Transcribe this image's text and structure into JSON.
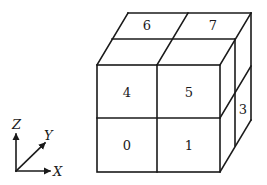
{
  "diagram": {
    "type": "cube-octant-numbering",
    "colors": {
      "stroke": "#1a1a1a",
      "background": "#ffffff"
    },
    "cells": [
      {
        "id": "0",
        "label": "0",
        "face": "front",
        "x": 127,
        "y": 145
      },
      {
        "id": "1",
        "label": "1",
        "face": "front",
        "x": 189,
        "y": 145
      },
      {
        "id": "4",
        "label": "4",
        "face": "front",
        "x": 127,
        "y": 92
      },
      {
        "id": "5",
        "label": "5",
        "face": "front",
        "x": 189,
        "y": 92
      },
      {
        "id": "6",
        "label": "6",
        "face": "top",
        "x": 147,
        "y": 25
      },
      {
        "id": "7",
        "label": "7",
        "face": "top",
        "x": 213,
        "y": 25
      },
      {
        "id": "3",
        "label": "3",
        "face": "right",
        "x": 243,
        "y": 109
      }
    ],
    "axes": {
      "x": {
        "label": "X"
      },
      "y": {
        "label": "Y"
      },
      "z": {
        "label": "Z"
      }
    }
  }
}
